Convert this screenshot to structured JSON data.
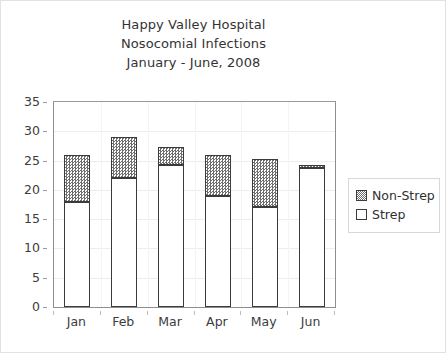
{
  "chart_data": {
    "type": "bar",
    "stacked": true,
    "title": "Happy Valley Hospital Nosocomial Infections January - June, 2008",
    "title_lines": [
      "Happy Valley Hospital",
      "Nosocomial Infections",
      "January - June, 2008"
    ],
    "categories": [
      "Jan",
      "Feb",
      "Mar",
      "Apr",
      "May",
      "Jun"
    ],
    "series": [
      {
        "name": "Strep",
        "values": [
          18.0,
          22.0,
          24.2,
          19.0,
          17.0,
          23.7
        ]
      },
      {
        "name": "Non-Strep",
        "values": [
          8.0,
          7.0,
          3.1,
          7.0,
          8.3,
          0.6
        ]
      }
    ],
    "totals": [
      26.0,
      29.0,
      27.3,
      26.0,
      25.3,
      24.3
    ],
    "xlabel": "",
    "ylabel": "",
    "ylim": [
      0,
      35
    ],
    "yticks": [
      0,
      5,
      10,
      15,
      20,
      25,
      30,
      35
    ],
    "ytick_labels": [
      "0",
      "5",
      "10",
      "15",
      "20",
      "25",
      "30",
      "35"
    ],
    "grid": true,
    "legend_position": "right",
    "legend_entries": [
      "Non-Strep",
      "Strep"
    ],
    "colors": {
      "strep_fill": "#ffffff",
      "nonstrep_fill": "#6e6e6e",
      "bar_outline": "#3b3b3b",
      "gridline": "#ededed",
      "axis": "#8e8e8e",
      "text": "#3c3c3c",
      "frame_border": "#e2e2e2",
      "background": "#ffffff"
    }
  }
}
